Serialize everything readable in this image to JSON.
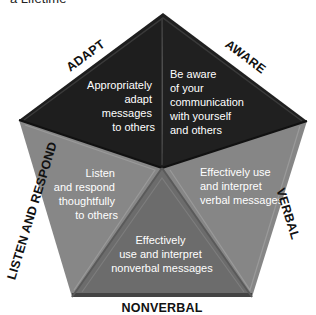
{
  "caption": "a Lifetime",
  "colors": {
    "top_segment": "#1e1e1e",
    "side_segment": "#878787",
    "bottom_segment": "#6c6c6c",
    "text_on_segment": "#ffffff",
    "label": "#111111"
  },
  "segments": {
    "adapt": {
      "label": "ADAPT",
      "lines": [
        "Appropriately",
        "adapt",
        "messages",
        "to others"
      ]
    },
    "aware": {
      "label": "AWARE",
      "lines": [
        "Be aware",
        "of your",
        "communication",
        "with yourself",
        "and others"
      ]
    },
    "verbal": {
      "label": "VERBAL",
      "lines": [
        "Effectively use",
        "and interpret",
        "verbal messages"
      ]
    },
    "nonverbal": {
      "label": "NONVERBAL",
      "lines": [
        "Effectively",
        "use and interpret",
        "nonverbal messages"
      ]
    },
    "listen": {
      "label": "LISTEN AND RESPOND",
      "lines": [
        "Listen",
        "and respond",
        "thoughtfully",
        "to others"
      ]
    }
  }
}
